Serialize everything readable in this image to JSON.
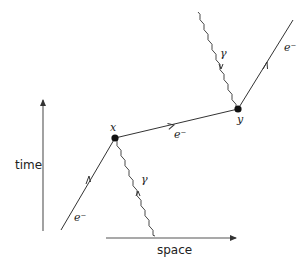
{
  "diagram": {
    "type": "feynman",
    "axes": {
      "time_label": "time",
      "space_label": "space"
    },
    "vertices": [
      {
        "id": "x",
        "label": "x"
      },
      {
        "id": "y",
        "label": "y"
      }
    ],
    "edges": [
      {
        "kind": "electron",
        "from": "in",
        "to": "x",
        "label": "e⁻"
      },
      {
        "kind": "electron",
        "from": "x",
        "to": "y",
        "label": "e⁻"
      },
      {
        "kind": "electron",
        "from": "y",
        "to": "out",
        "label": "e⁻"
      },
      {
        "kind": "photon",
        "from": "x",
        "to": "out",
        "label": "γ"
      },
      {
        "kind": "photon",
        "from": "in",
        "to": "y",
        "label": "γ"
      }
    ],
    "colors": {
      "line": "#333333",
      "background": "#ffffff"
    }
  }
}
